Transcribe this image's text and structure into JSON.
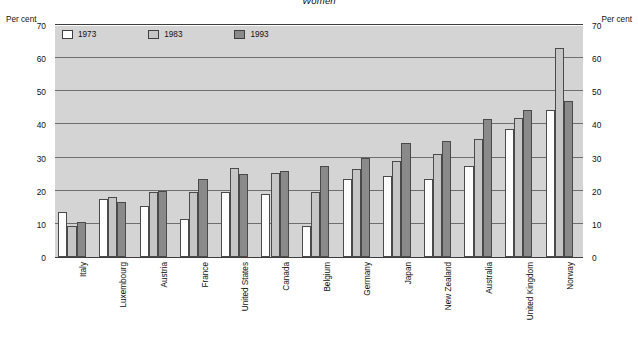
{
  "chart_data": {
    "type": "bar",
    "title": "Women",
    "xlabel": "",
    "ylabel": "Per cent",
    "ylabel_right": "Per cent",
    "ylim": [
      0,
      70
    ],
    "ytick_step": 10,
    "yticks": [
      0,
      10,
      20,
      30,
      40,
      50,
      60,
      70
    ],
    "grid": true,
    "legend_position": "top-left-inside",
    "categories": [
      "Italy",
      "Luxembourg",
      "Austria",
      "France",
      "United States",
      "Canada",
      "Belgium",
      "Germany",
      "Japan",
      "New Zealand",
      "Australia",
      "United Kingdom",
      "Norway"
    ],
    "series": [
      {
        "name": "1973",
        "color": "#ffffff",
        "values": [
          13.5,
          17.5,
          15.5,
          11.5,
          19.5,
          19.0,
          9.5,
          23.5,
          24.5,
          23.5,
          27.5,
          38.5,
          44.5
        ]
      },
      {
        "name": "1983",
        "color": "#c6c6c6",
        "values": [
          9.5,
          18.0,
          19.5,
          19.5,
          27.0,
          25.5,
          19.5,
          26.5,
          29.0,
          31.0,
          35.5,
          42.0,
          63.0
        ]
      },
      {
        "name": "1993",
        "color": "#8a8a8a",
        "values": [
          10.5,
          16.5,
          20.0,
          23.5,
          25.0,
          26.0,
          27.5,
          30.0,
          34.5,
          35.0,
          41.5,
          44.5,
          47.0
        ]
      }
    ]
  }
}
